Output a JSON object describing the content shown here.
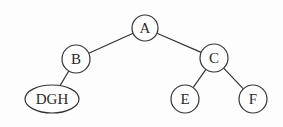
{
  "diagram": {
    "type": "binary-tree",
    "nodes": [
      {
        "id": "A",
        "label": "A",
        "cx": 145,
        "cy": 28,
        "rx": 13,
        "ry": 13
      },
      {
        "id": "B",
        "label": "B",
        "cx": 76,
        "cy": 59,
        "rx": 14,
        "ry": 14
      },
      {
        "id": "C",
        "label": "C",
        "cx": 214,
        "cy": 58,
        "rx": 14,
        "ry": 14
      },
      {
        "id": "DGH",
        "label": "DGH",
        "cx": 52,
        "cy": 99,
        "rx": 27,
        "ry": 14
      },
      {
        "id": "E",
        "label": "E",
        "cx": 185,
        "cy": 99,
        "rx": 14,
        "ry": 14
      },
      {
        "id": "F",
        "label": "F",
        "cx": 253,
        "cy": 99,
        "rx": 14,
        "ry": 14
      }
    ],
    "edges": [
      {
        "from": "A",
        "to": "B"
      },
      {
        "from": "A",
        "to": "C"
      },
      {
        "from": "B",
        "to": "DGH"
      },
      {
        "from": "C",
        "to": "E"
      },
      {
        "from": "C",
        "to": "F"
      }
    ],
    "colors": {
      "stroke": "#333333",
      "fill": "#ffffff",
      "background": "#fdfdfd"
    }
  }
}
